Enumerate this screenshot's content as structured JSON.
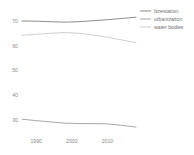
{
  "chart_data": {
    "type": "line",
    "title": "",
    "subtitle": "",
    "xlabel": "",
    "ylabel": "",
    "xlim": [
      1986,
      2018
    ],
    "ylim": [
      25,
      72
    ],
    "grid": false,
    "legend_position": "top-right",
    "xticks": [
      "1990",
      "2000",
      "2010"
    ],
    "xtick_values": [
      1990,
      2000,
      2010
    ],
    "yticks": [
      "70",
      "60",
      "50",
      "40",
      "30"
    ],
    "ytick_values": [
      70,
      60,
      50,
      40,
      30
    ],
    "x": [
      1986,
      1990,
      1994,
      1998,
      2002,
      2006,
      2010,
      2014,
      2018
    ],
    "series": [
      {
        "name": "forestation",
        "color": "#8c8c8c",
        "values": [
          70.0,
          69.9,
          69.7,
          69.5,
          69.7,
          70.1,
          70.5,
          71.0,
          71.5
        ]
      },
      {
        "name": "urbanization",
        "color": "#a8a8a8",
        "values": [
          30.2,
          29.6,
          29.1,
          28.6,
          28.4,
          28.4,
          28.3,
          27.7,
          27.0
        ]
      },
      {
        "name": "water bodies",
        "color": "#cfcfcf",
        "values": [
          64.2,
          64.6,
          65.0,
          65.3,
          65.0,
          64.3,
          63.4,
          62.3,
          61.2
        ]
      }
    ]
  },
  "legend": {
    "entries": [
      {
        "label": "forestation",
        "color": "#8c8c8c"
      },
      {
        "label": "urbanization",
        "color": "#a8a8a8"
      },
      {
        "label": "water bodies",
        "color": "#cfcfcf"
      }
    ]
  },
  "axes": {
    "y_tick_labels": [
      "70",
      "60",
      "50",
      "40",
      "30"
    ],
    "x_tick_labels": [
      "1990",
      "2000",
      "2010"
    ]
  }
}
